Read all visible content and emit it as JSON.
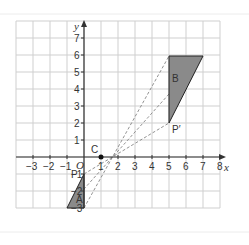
{
  "diagram": {
    "type": "coordinate-grid-enlargement",
    "axes": {
      "x_label": "x",
      "y_label": "y",
      "origin_label": "O",
      "x_ticks": [
        "−3",
        "−2",
        "−1",
        "1",
        "2",
        "3",
        "4",
        "5",
        "6",
        "7",
        "8"
      ],
      "y_ticks_pos": [
        "1",
        "2",
        "3",
        "4",
        "5",
        "6",
        "7"
      ],
      "y_ticks_neg": [
        "−1",
        "−2",
        "−3"
      ]
    },
    "centre": {
      "label": "C",
      "x": 1,
      "y": 0
    },
    "shape_A": {
      "label": "A",
      "vertices": [
        [
          -1,
          -1
        ],
        [
          -1,
          -3
        ],
        [
          -2,
          -3
        ]
      ],
      "point_label": "P"
    },
    "shape_B": {
      "label": "B",
      "vertices": [
        [
          5,
          2
        ],
        [
          5,
          6
        ],
        [
          7,
          6
        ]
      ],
      "point_label": "P′"
    },
    "colors": {
      "fill": "#8a8a8a",
      "grid": "#cfcfcf",
      "axis": "#333333"
    }
  }
}
